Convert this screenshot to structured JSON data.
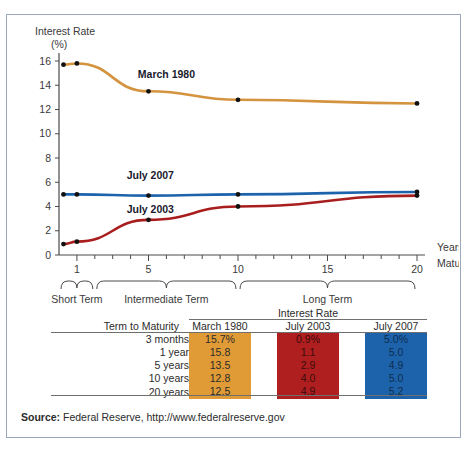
{
  "figure": {
    "border_color": "#9aa8bd",
    "source_label": "Source:",
    "source_text": " Federal Reserve, http://www.federalreserve.gov"
  },
  "chart_data": {
    "type": "line",
    "title": "",
    "ylabel_line1": "Interest Rate",
    "ylabel_line2": "(%)",
    "xlabel_line1": "Years to",
    "xlabel_line2": "Maturity",
    "x": [
      0.25,
      1,
      5,
      10,
      20
    ],
    "xticks": [
      1,
      5,
      10,
      15,
      20
    ],
    "xtick_labels": [
      "1",
      "5",
      "10",
      "15",
      "20"
    ],
    "xlim": [
      0,
      20
    ],
    "yticks": [
      0,
      2,
      4,
      6,
      8,
      10,
      12,
      14,
      16
    ],
    "ytick_labels": [
      "0",
      "2",
      "4",
      "6",
      "8",
      "10",
      "12",
      "14",
      "16"
    ],
    "ylim": [
      0,
      16
    ],
    "grid": false,
    "legend_position": "inline-labels",
    "series": [
      {
        "name": "March 1980",
        "color": "#d4933e",
        "values": [
          15.7,
          15.8,
          13.5,
          12.8,
          12.5
        ],
        "label_x": 6.0,
        "label_y": 14.6
      },
      {
        "name": "July 2007",
        "color": "#1d63ac",
        "values": [
          5.0,
          5.0,
          4.9,
          5.0,
          5.2
        ],
        "label_x": 5.1,
        "label_y": 6.3
      },
      {
        "name": "July 2003",
        "color": "#a81e1e",
        "values": [
          0.9,
          1.1,
          2.9,
          4.0,
          4.9
        ],
        "label_x": 5.1,
        "label_y": 3.5
      }
    ],
    "brace_groups": [
      {
        "label": "Short Term",
        "from": 0.0,
        "to": 2.0
      },
      {
        "label": "Intermediate Term",
        "from": 2.0,
        "to": 10.0
      },
      {
        "label": "Long Term",
        "from": 10.0,
        "to": 20.0
      }
    ]
  },
  "table": {
    "group_header": "Interest Rate",
    "columns": [
      "Term to Maturity",
      "March 1980",
      "July 2003",
      "July 2007"
    ],
    "rows": [
      {
        "term": "3 months",
        "march_1980": "15.7%",
        "july_2003": "0.9%",
        "july_2007": "5.0%"
      },
      {
        "term": "1 year",
        "march_1980": "15.8",
        "july_2003": "1.1",
        "july_2007": "5.0"
      },
      {
        "term": "5 years",
        "march_1980": "13.5",
        "july_2003": "2.9",
        "july_2007": "4.9"
      },
      {
        "term": "10 years",
        "march_1980": "12.8",
        "july_2003": "4.0",
        "july_2007": "5.0"
      },
      {
        "term": "20 years",
        "march_1980": "12.5",
        "july_2003": "4.9",
        "july_2007": "5.2"
      }
    ],
    "colors": {
      "march_1980": "#e09b36",
      "july_2003": "#b01f1f",
      "july_2007": "#1d63ac"
    }
  }
}
